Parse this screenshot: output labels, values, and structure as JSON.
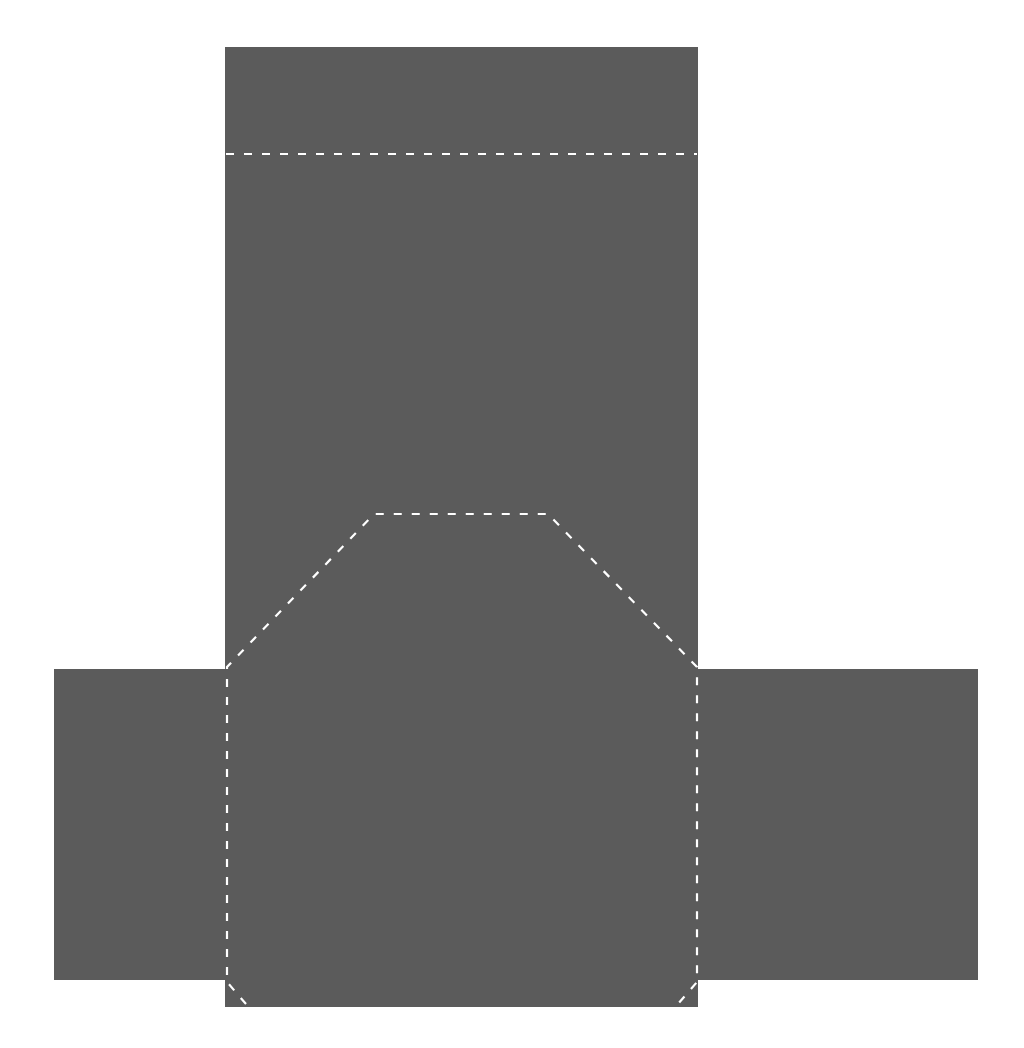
{
  "diagram": {
    "type": "packaging-dieline",
    "canvas": {
      "width": 1024,
      "height": 1048,
      "background": "#ffffff"
    },
    "colors": {
      "panel_fill": "#5b5b5b",
      "fold_line": "#ffffff"
    },
    "fold_line_style": {
      "stroke_width": 2.2,
      "dash": "8 10"
    },
    "panels": [
      {
        "id": "main-panel",
        "label": "main-panel",
        "x": 225,
        "y": 47,
        "width": 473,
        "height": 960
      },
      {
        "id": "left-flap",
        "label": "left-flap",
        "x": 54,
        "y": 669,
        "width": 172,
        "height": 311
      },
      {
        "id": "right-flap",
        "label": "right-flap",
        "x": 698,
        "y": 669,
        "width": 280,
        "height": 311
      }
    ],
    "fold_lines": [
      {
        "id": "top-fold-line",
        "points": [
          [
            226,
            154
          ],
          [
            697,
            154
          ]
        ]
      },
      {
        "id": "octagon-fold-line",
        "points": [
          [
            246,
            1004
          ],
          [
            227,
            982
          ],
          [
            227,
            667
          ],
          [
            374,
            514
          ],
          [
            548,
            514
          ],
          [
            697,
            667
          ],
          [
            697,
            982
          ],
          [
            678,
            1004
          ]
        ]
      }
    ]
  }
}
